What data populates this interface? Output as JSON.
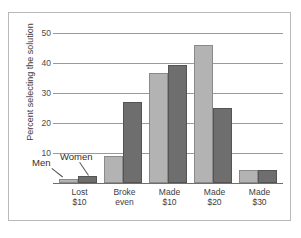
{
  "chart_data": {
    "type": "bar",
    "title": "",
    "xlabel": "",
    "ylabel": "Percent selecting the solution",
    "categories": [
      "Lost\n$10",
      "Broke\neven",
      "Made\n$10",
      "Made\n$20",
      "Made\n$30"
    ],
    "category_lines": [
      [
        "Lost",
        "$10"
      ],
      [
        "Broke",
        "even"
      ],
      [
        "Made",
        "$10"
      ],
      [
        "Made",
        "$20"
      ],
      [
        "Made",
        "$30"
      ]
    ],
    "series": [
      {
        "name": "Men",
        "color": "#b3b3b3",
        "values": [
          1.5,
          9.5,
          38,
          48,
          4.5
        ]
      },
      {
        "name": "Women",
        "color": "#6e6e6e",
        "values": [
          2.5,
          28,
          41,
          26,
          4.5
        ]
      }
    ],
    "ylim": [
      0,
      52
    ],
    "yticks": [
      10,
      20,
      30,
      40,
      50
    ],
    "ytick_labels": [
      "10",
      "20",
      "30",
      "40",
      "50"
    ],
    "grid": true,
    "legend_position": "inside-lower-left-callout",
    "annotations": [
      {
        "text": "Men",
        "points_to": "lost-10-men-bar"
      },
      {
        "text": "Women",
        "points_to": "lost-10-women-bar"
      }
    ]
  },
  "axis": {
    "y_title": "Percent selecting the solution",
    "ticks": [
      "50",
      "40",
      "30",
      "20",
      "10"
    ]
  },
  "legend": {
    "men_label": "Men",
    "women_label": "Women"
  },
  "xlabels": [
    {
      "line1": "Lost",
      "line2": "$10"
    },
    {
      "line1": "Broke",
      "line2": "even"
    },
    {
      "line1": "Made",
      "line2": "$10"
    },
    {
      "line1": "Made",
      "line2": "$20"
    },
    {
      "line1": "Made",
      "line2": "$30"
    }
  ]
}
